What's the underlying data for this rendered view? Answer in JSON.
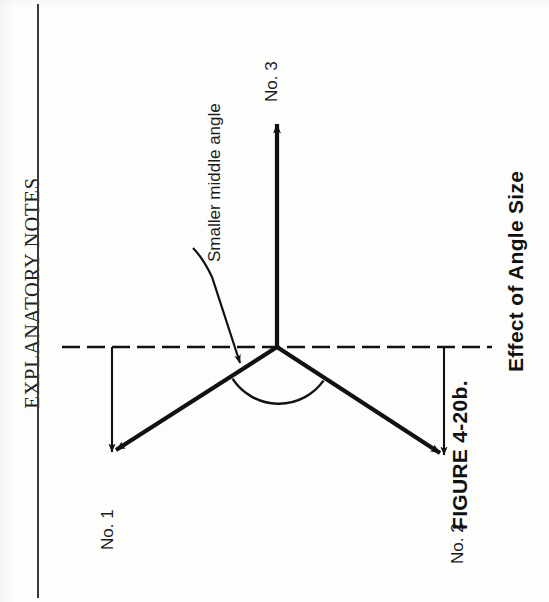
{
  "page": {
    "running_head": "EXPLANATORY NOTES",
    "background_color": "#fdfdfc",
    "ink_color": "#111111"
  },
  "caption": {
    "number": "FIGURE 4-20b.",
    "title": "Effect of Angle Size"
  },
  "diagram": {
    "name": "three-ray-angle-diagram",
    "annotation": "Smaller middle angle",
    "ray_labels": {
      "ray1": "No. 1",
      "ray2": "No. 2",
      "ray3": "No. 3"
    },
    "vertex": {
      "x": 277,
      "y": 347
    },
    "reference_line": {
      "kind": "dashed-horizontal",
      "y": 347,
      "x_start": 62,
      "x_end": 492,
      "dash": "18 7"
    },
    "rays": [
      {
        "label": "No. 1",
        "from_x": 277,
        "from_y": 347,
        "to_x": 113,
        "to_y": 452,
        "arrow": true
      },
      {
        "label": "No. 2",
        "from_x": 277,
        "from_y": 347,
        "to_x": 443,
        "to_y": 455,
        "arrow": true
      },
      {
        "label": "No. 3",
        "from_x": 277,
        "from_y": 347,
        "to_x": 277,
        "to_y": 122,
        "arrow": true
      }
    ],
    "drop_lines": [
      {
        "for": "No. 1",
        "x": 112,
        "y_start": 347,
        "y_end": 452,
        "arrow": true
      },
      {
        "for": "No. 2",
        "x": 444,
        "y_start": 347,
        "y_end": 455,
        "arrow": true
      }
    ],
    "angle_arc": {
      "describes": "middle angle between ray No. 1 and ray No. 2",
      "center_x": 277,
      "center_y": 347,
      "radius": 55
    },
    "leader": {
      "from_x": 196,
      "from_y": 250,
      "bend_x": 213,
      "bend_y": 277,
      "to_x": 242,
      "to_y": 365,
      "arrow": true
    }
  }
}
